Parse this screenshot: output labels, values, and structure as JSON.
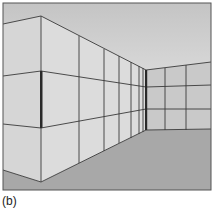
{
  "figure": {
    "label": "(b)",
    "colors": {
      "ceiling_top": "#c9c9c9",
      "ceiling_bottom": "#f7f7f7",
      "near_wall": "#d9d9d9",
      "side_wall": "#dedede",
      "back_wall": "#c8c8c8",
      "floor": "#a9a9a9",
      "grid_line": "#3a3a3a",
      "corner_shadow": "#2a2a2a",
      "frame": "#555555"
    }
  }
}
